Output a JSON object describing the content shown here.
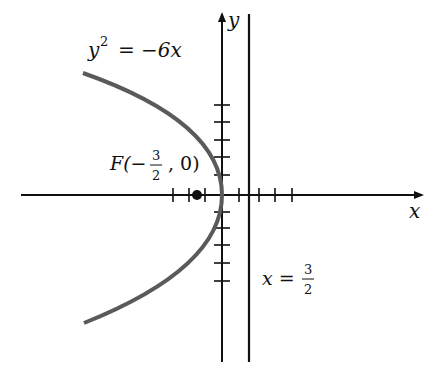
{
  "diagram": {
    "type": "parabola-graph",
    "equation": {
      "lhs": "y",
      "exp": "2",
      "rhs": "= −6x"
    },
    "focus": {
      "prefix": "F(−",
      "num": "3",
      "den": "2",
      "suffix": ", 0)"
    },
    "directrix": {
      "lhs": "x =",
      "num": "3",
      "den": "2"
    },
    "axis_labels": {
      "x": "x",
      "y": "y"
    },
    "colors": {
      "axes": "#111111",
      "curve": "#5a5a5a",
      "focus_dot": "#111111"
    }
  }
}
